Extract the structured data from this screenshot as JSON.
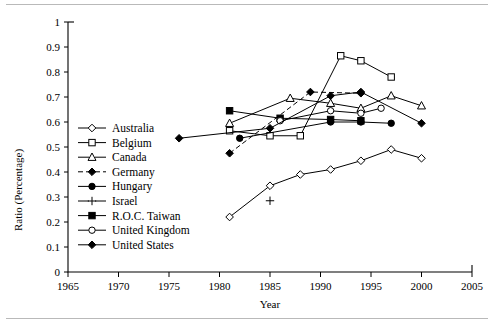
{
  "figure": {
    "axis_title_y": "Ratio (Percentage)",
    "axis_title_x": "Year"
  },
  "chart_data": {
    "type": "line",
    "title": "",
    "xlabel": "Year",
    "ylabel": "Ratio (Percentage)",
    "xlim": [
      1965,
      2005
    ],
    "ylim": [
      0,
      1
    ],
    "xticks": [
      1965,
      1970,
      1975,
      1980,
      1985,
      1990,
      1995,
      2000,
      2005
    ],
    "yticks": [
      0,
      0.1,
      0.2,
      0.3,
      0.4,
      0.5,
      0.6,
      0.7,
      0.8,
      0.9,
      1
    ],
    "grid": false,
    "legend_position": "inside-left",
    "series": [
      {
        "name": "Australia",
        "marker": "open-diamond",
        "linestyle": "solid",
        "x": [
          1981,
          1985,
          1988,
          1991,
          1994,
          1997,
          2000
        ],
        "y": [
          0.22,
          0.345,
          0.39,
          0.41,
          0.445,
          0.49,
          0.455
        ]
      },
      {
        "name": "Belgium",
        "marker": "open-square",
        "linestyle": "solid",
        "x": [
          1981,
          1985,
          1988,
          1992,
          1994,
          1997
        ],
        "y": [
          0.565,
          0.545,
          0.545,
          0.865,
          0.845,
          0.78
        ]
      },
      {
        "name": "Canada",
        "marker": "open-triangle",
        "linestyle": "solid",
        "x": [
          1981,
          1987,
          1991,
          1994,
          1997,
          2000
        ],
        "y": [
          0.595,
          0.695,
          0.675,
          0.655,
          0.705,
          0.665
        ]
      },
      {
        "name": "Germany",
        "marker": "solid-diamond",
        "linestyle": "dashed",
        "x": [
          1981,
          1989,
          1994
        ],
        "y": [
          0.475,
          0.72,
          0.715
        ]
      },
      {
        "name": "Hungary",
        "marker": "solid-circle",
        "linestyle": "solid",
        "x": [
          1982,
          1991,
          1994,
          1997
        ],
        "y": [
          0.535,
          0.6,
          0.6,
          0.595
        ]
      },
      {
        "name": "Israel",
        "marker": "plus",
        "linestyle": "solid",
        "x": [
          1985
        ],
        "y": [
          0.285
        ]
      },
      {
        "name": "R.O.C. Taiwan",
        "marker": "solid-square",
        "linestyle": "solid",
        "x": [
          1981,
          1986,
          1991,
          1994
        ],
        "y": [
          0.645,
          0.615,
          0.61,
          0.605
        ]
      },
      {
        "name": "United Kingdom",
        "marker": "open-circle",
        "linestyle": "solid",
        "x": [
          1986,
          1991,
          1994,
          1996
        ],
        "y": [
          0.605,
          0.645,
          0.635,
          0.655
        ]
      },
      {
        "name": "United States",
        "marker": "solid-diamond",
        "linestyle": "solid",
        "x": [
          1976,
          1985,
          1991,
          1994,
          2000
        ],
        "y": [
          0.535,
          0.575,
          0.705,
          0.72,
          0.595
        ]
      }
    ]
  },
  "legend": {
    "items": [
      {
        "label": "Australia",
        "marker": "open-diamond",
        "linestyle": "solid"
      },
      {
        "label": "Belgium",
        "marker": "open-square",
        "linestyle": "solid"
      },
      {
        "label": "Canada",
        "marker": "open-triangle",
        "linestyle": "solid"
      },
      {
        "label": "Germany",
        "marker": "solid-diamond",
        "linestyle": "dashed"
      },
      {
        "label": "Hungary",
        "marker": "solid-circle",
        "linestyle": "solid"
      },
      {
        "label": "Israel",
        "marker": "plus",
        "linestyle": "solid"
      },
      {
        "label": "R.O.C. Taiwan",
        "marker": "solid-square",
        "linestyle": "solid"
      },
      {
        "label": "United Kingdom",
        "marker": "open-circle",
        "linestyle": "solid"
      },
      {
        "label": "United States",
        "marker": "solid-diamond",
        "linestyle": "solid"
      }
    ]
  }
}
